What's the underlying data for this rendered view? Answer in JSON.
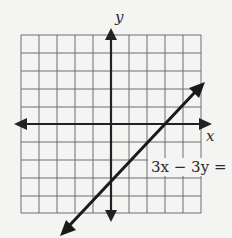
{
  "graph": {
    "x_axis_label": "x",
    "y_axis_label": "y",
    "equation_label": "3x − 3y = 9",
    "grid": {
      "columns": 10,
      "rows": 10,
      "x_range": [
        -5,
        5
      ],
      "y_range": [
        -5,
        5
      ]
    },
    "line": {
      "equation": "3x - 3y = 9",
      "slope": 1,
      "y_intercept": -3,
      "x_intercept": 3
    }
  },
  "colors": {
    "grid": "#707070",
    "axis": "#222222",
    "line": "#1a1a1a",
    "background": "#f4f4f3"
  }
}
